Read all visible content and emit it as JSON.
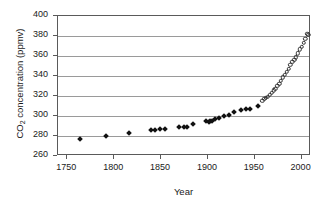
{
  "chart_data": {
    "type": "scatter",
    "title": "",
    "xlabel": "Year",
    "ylabel_prefix": "CO",
    "ylabel_sub": "2",
    "ylabel_suffix": " concentration (ppmv)",
    "ylabel": "CO2 concentration (ppmv)",
    "xlim": [
      1740,
      2010
    ],
    "ylim": [
      260,
      400
    ],
    "xticks": [
      1750,
      1800,
      1850,
      1900,
      1950,
      2000
    ],
    "yticks": [
      260,
      280,
      300,
      320,
      340,
      360,
      380,
      400
    ],
    "grid": "horizontal",
    "legend": "none",
    "marker_color": "#111111",
    "gridline_color": "#9a9a9a",
    "axis_color": "#5a5a5a",
    "background": "#ffffff",
    "series": [
      {
        "name": "ice-core record",
        "marker": "filled-diamond",
        "points": [
          [
            1763,
            277.0
          ],
          [
            1791,
            280.0
          ],
          [
            1816,
            282.6
          ],
          [
            1839,
            286.4
          ],
          [
            1843,
            285.9
          ],
          [
            1849,
            286.8
          ],
          [
            1854,
            287.0
          ],
          [
            1869,
            288.6
          ],
          [
            1874,
            288.9
          ],
          [
            1878,
            288.9
          ],
          [
            1884,
            291.6
          ],
          [
            1898,
            294.6
          ],
          [
            1901,
            294.3
          ],
          [
            1902,
            295.0
          ],
          [
            1904,
            294.8
          ],
          [
            1908,
            296.7
          ],
          [
            1912,
            298.0
          ],
          [
            1917,
            300.0
          ],
          [
            1922,
            301.4
          ],
          [
            1928,
            304.4
          ],
          [
            1935,
            305.6
          ],
          [
            1941,
            306.8
          ],
          [
            1945,
            307.0
          ],
          [
            1953,
            310.4
          ]
        ]
      },
      {
        "name": "Mauna Loa record",
        "marker": "open-circle",
        "points": [
          [
            1958,
            315.0
          ],
          [
            1960,
            316.9
          ],
          [
            1962,
            318.4
          ],
          [
            1964,
            319.2
          ],
          [
            1966,
            321.4
          ],
          [
            1968,
            323.1
          ],
          [
            1970,
            325.7
          ],
          [
            1972,
            327.5
          ],
          [
            1974,
            330.2
          ],
          [
            1976,
            332.1
          ],
          [
            1978,
            335.4
          ],
          [
            1980,
            338.7
          ],
          [
            1982,
            341.1
          ],
          [
            1984,
            344.4
          ],
          [
            1986,
            347.2
          ],
          [
            1988,
            351.5
          ],
          [
            1990,
            354.2
          ],
          [
            1992,
            356.4
          ],
          [
            1994,
            358.8
          ],
          [
            1996,
            362.6
          ],
          [
            1998,
            366.6
          ],
          [
            2000,
            369.5
          ],
          [
            2002,
            373.2
          ],
          [
            2004,
            377.5
          ],
          [
            2006,
            381.9
          ],
          [
            2007,
            381.0
          ]
        ]
      }
    ]
  }
}
